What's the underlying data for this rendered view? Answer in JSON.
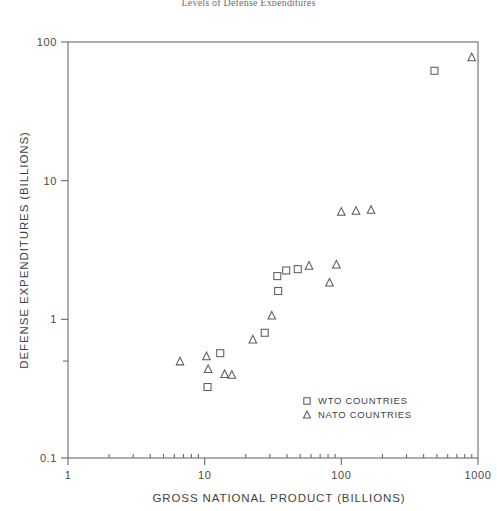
{
  "figure": {
    "title": "Levels of Defense Expenditures"
  },
  "chart_data": {
    "type": "scatter",
    "title": "Levels of Defense Expenditures",
    "xlabel": "GROSS NATIONAL PRODUCT (BILLIONS)",
    "ylabel": "DEFENSE EXPENDITURES (BILLIONS)",
    "xscale": "log",
    "yscale": "log",
    "xlim": [
      1,
      1000
    ],
    "ylim": [
      0.1,
      100
    ],
    "xticks": [
      1,
      10,
      100,
      1000
    ],
    "xtick_labels": [
      "1",
      "10",
      "100",
      "1000"
    ],
    "yticks": [
      0.1,
      1,
      10,
      100
    ],
    "ytick_labels": [
      "0.1",
      "1",
      "10",
      "100"
    ],
    "grid": false,
    "legend_position": "lower right",
    "series": [
      {
        "name": "WTO COUNTRIES",
        "marker": "square",
        "points": [
          {
            "x": 10.5,
            "y": 0.325
          },
          {
            "x": 13.0,
            "y": 0.57
          },
          {
            "x": 27.5,
            "y": 0.8
          },
          {
            "x": 34.0,
            "y": 2.05
          },
          {
            "x": 39.5,
            "y": 2.25
          },
          {
            "x": 34.5,
            "y": 1.6
          },
          {
            "x": 48.0,
            "y": 2.3
          },
          {
            "x": 480.0,
            "y": 62.0
          }
        ]
      },
      {
        "name": "NATO COUNTRIES",
        "marker": "triangle",
        "points": [
          {
            "x": 6.6,
            "y": 0.5
          },
          {
            "x": 10.3,
            "y": 0.545
          },
          {
            "x": 10.6,
            "y": 0.44
          },
          {
            "x": 14.0,
            "y": 0.405
          },
          {
            "x": 15.8,
            "y": 0.4
          },
          {
            "x": 22.5,
            "y": 0.72
          },
          {
            "x": 31.0,
            "y": 1.07
          },
          {
            "x": 58.0,
            "y": 2.45
          },
          {
            "x": 82.0,
            "y": 1.85
          },
          {
            "x": 92.0,
            "y": 2.5
          },
          {
            "x": 100.0,
            "y": 6.0
          },
          {
            "x": 128.0,
            "y": 6.1
          },
          {
            "x": 165.0,
            "y": 6.2
          },
          {
            "x": 900.0,
            "y": 78.0
          }
        ]
      }
    ],
    "legend_entries": [
      {
        "marker": "square",
        "label": "WTO COUNTRIES"
      },
      {
        "marker": "triangle",
        "label": "NATO COUNTRIES"
      }
    ]
  }
}
